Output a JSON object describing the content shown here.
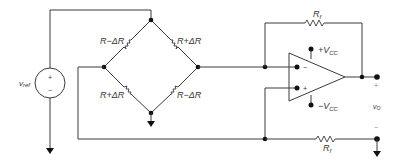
{
  "diagram": {
    "type": "Wheatstone bridge with differential op-amp amplifier",
    "source": {
      "label": "v",
      "subscript": "ref",
      "plus": "+",
      "minus": "−"
    },
    "bridge": {
      "top_left": "R−ΔR",
      "top_right": "R+ΔR",
      "bottom_left": "R+ΔR",
      "bottom_right": "R−ΔR"
    },
    "opamp": {
      "inverting": "−",
      "noninverting": "+",
      "supply_pos": "+V",
      "supply_pos_sub": "CC",
      "supply_neg": "−V",
      "supply_neg_sub": "CC"
    },
    "feedback_top": {
      "label": "R",
      "subscript": "f"
    },
    "feedback_bottom": {
      "label": "R",
      "subscript": "f"
    },
    "output": {
      "label": "v",
      "subscript": "O",
      "plus": "+",
      "minus": "−"
    },
    "colors": {
      "wire": "#3a3a3a",
      "node": "#111111",
      "background": "#ffffff"
    }
  }
}
